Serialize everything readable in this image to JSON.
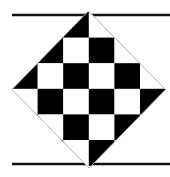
{
  "figure": {
    "width": 170,
    "height": 177,
    "background": "#ffffff",
    "colors": {
      "dark": "#000000",
      "light": "#ffffff",
      "outline": "#9a9a9a",
      "rule": "#111111"
    },
    "rules": [
      {
        "name": "top-rule",
        "x1": 12,
        "x2": 170,
        "y": 15,
        "thickness": 2.4
      },
      {
        "name": "bottom-rule",
        "x1": 12,
        "x2": 170,
        "y": 164,
        "thickness": 2.4
      }
    ],
    "diamond": {
      "top": [
        88.5,
        11
      ],
      "right": [
        165.5,
        89.5
      ],
      "bottom": [
        89,
        168
      ],
      "left": [
        12,
        89.5
      ],
      "outline_width": 0.8
    },
    "checkerboard": {
      "origin_x": 12,
      "origin_y": 12,
      "cell_size": 25.6,
      "cols": 6,
      "rows": 6,
      "dark_parity": "even"
    }
  }
}
